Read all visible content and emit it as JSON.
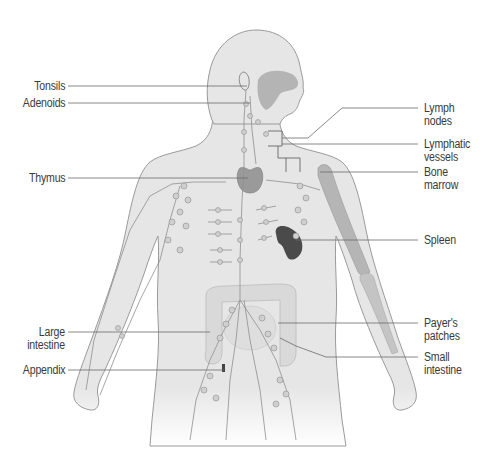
{
  "colors": {
    "skin_fill": "#e6e6e6",
    "skin_outline": "#9a9a9a",
    "node_fill": "#cfcfcf",
    "organ_dark": "#555555",
    "organ_mid": "#9a9a9a",
    "bone": "#b8b8b8",
    "leader_line": "#6a6a6a",
    "label_text": "#3a3a3a"
  },
  "labels_left": [
    {
      "id": "tonsils",
      "lines": [
        "Tonsils"
      ]
    },
    {
      "id": "adenoids",
      "lines": [
        "Adenoids"
      ]
    },
    {
      "id": "thymus",
      "lines": [
        "Thymus"
      ]
    },
    {
      "id": "large-intestine",
      "lines": [
        "Large",
        "intestine"
      ]
    },
    {
      "id": "appendix",
      "lines": [
        "Appendix"
      ]
    }
  ],
  "labels_right": [
    {
      "id": "lymph-nodes",
      "lines": [
        "Lymph",
        "nodes"
      ]
    },
    {
      "id": "lymphatic-vessels",
      "lines": [
        "Lymphatic",
        "vessels"
      ]
    },
    {
      "id": "bone-marrow",
      "lines": [
        "Bone",
        "marrow"
      ]
    },
    {
      "id": "spleen",
      "lines": [
        "Spleen"
      ]
    },
    {
      "id": "payers-patches",
      "lines": [
        "Payer's",
        "patches"
      ]
    },
    {
      "id": "small-intestine",
      "lines": [
        "Small",
        "intestine"
      ]
    }
  ]
}
